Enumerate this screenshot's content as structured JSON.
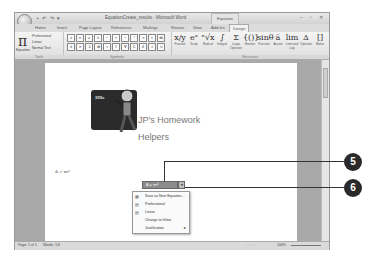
{
  "window": {
    "title": "EquationCreate_results - Microsoft Word",
    "context_tab_title": "Equation Tools",
    "qat": "▪ ↶ ↷ ▾",
    "controls": "– ▫ ✕"
  },
  "tabs": [
    {
      "label": "Home"
    },
    {
      "label": "Insert"
    },
    {
      "label": "Page Layout"
    },
    {
      "label": "References"
    },
    {
      "label": "Mailings"
    },
    {
      "label": "Review"
    },
    {
      "label": "View"
    },
    {
      "label": "Add-Ins"
    },
    {
      "label": "Design"
    }
  ],
  "ribbon": {
    "tools_group": {
      "equation_label": "Equation",
      "professional": "Professional",
      "linear": "Linear",
      "normal_text": "Normal Text",
      "group_label": "Tools"
    },
    "symbols_group": {
      "symbols": [
        "±",
        "∞",
        "=",
        "≠",
        "~",
        "×",
        "÷",
        "!",
        "∝",
        "<",
        "≪",
        "≤",
        "≥",
        "∓",
        "≅",
        "≈",
        "≡",
        "∀",
        "∁",
        "∂",
        "√",
        "∪"
      ],
      "group_label": "Symbols"
    },
    "structures_group": {
      "items": [
        {
          "glyph": "x/y",
          "label": "Fraction"
        },
        {
          "glyph": "eˣ",
          "label": "Script"
        },
        {
          "glyph": "ⁿ√x",
          "label": "Radical"
        },
        {
          "glyph": "∫",
          "label": "Integral"
        },
        {
          "glyph": "Σ",
          "label": "Large Operator"
        },
        {
          "glyph": "{()}",
          "label": "Bracket"
        },
        {
          "glyph": "sinθ",
          "label": "Function"
        },
        {
          "glyph": "ä",
          "label": "Accent"
        },
        {
          "glyph": "lim",
          "label": "Limit and Log"
        },
        {
          "glyph": "Δ",
          "label": "Operator"
        },
        {
          "glyph": "[]",
          "label": "Matrix"
        }
      ],
      "group_label": "Structures"
    }
  },
  "document": {
    "board_text": "3X5=",
    "logo_line1": "JP's Homework",
    "logo_line2": "Helpers",
    "equation_text": "A = πr²",
    "equation_box_text": "A = πr²",
    "equation_dropdown": "▾"
  },
  "context_menu": {
    "items": [
      {
        "label": "Save as New Equation...",
        "icon": "save-eq"
      },
      {
        "label": "Professional",
        "icon": "professional"
      },
      {
        "label": "Linear",
        "icon": "linear"
      },
      {
        "label": "Change to Inline",
        "icon": ""
      },
      {
        "label": "Justification",
        "icon": "",
        "submenu": "▸"
      }
    ]
  },
  "status_bar": {
    "page": "Page: 1 of 1",
    "words": "Words: 1/4",
    "zoom": "100%"
  },
  "callouts": [
    {
      "number": "5"
    },
    {
      "number": "6"
    }
  ]
}
